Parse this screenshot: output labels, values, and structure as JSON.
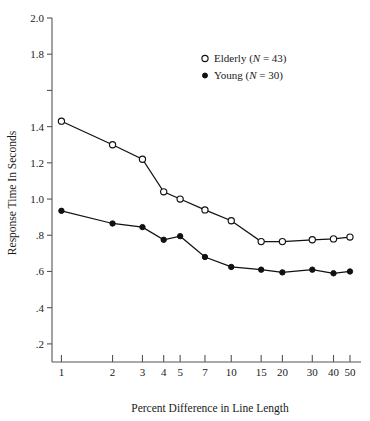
{
  "chart_data": {
    "type": "line",
    "title": "",
    "xlabel": "Percent Difference in Line Length",
    "ylabel": "Response Time In Seconds",
    "x_scale": "log",
    "x": [
      1,
      2,
      3,
      4,
      5,
      7,
      10,
      15,
      20,
      30,
      40,
      50
    ],
    "xticks": [
      1,
      2,
      3,
      4,
      5,
      7,
      10,
      15,
      20,
      30,
      40,
      50
    ],
    "xtick_labels": [
      "1",
      "2",
      "3",
      "4",
      "5",
      "7",
      "10",
      "15",
      "20",
      "30",
      "40",
      "50"
    ],
    "xlim": [
      0.88,
      55
    ],
    "yticks": [
      0.2,
      0.4,
      0.6,
      0.8,
      1.0,
      1.2,
      1.4,
      1.6,
      1.8,
      2.0
    ],
    "ytick_labels": [
      ".2",
      ".4",
      ".6",
      ".8",
      "1.0",
      "1.2",
      "1.4",
      "1.6",
      "1.8",
      "2.0"
    ],
    "ytick_labels_shown": [
      ".2",
      ".4",
      ".6",
      ".8",
      "1.0",
      "1.2",
      "1.4",
      "",
      "1.8",
      "2.0"
    ],
    "ylim": [
      0.1,
      2.0
    ],
    "grid": false,
    "legend_position": "upper-right",
    "series": [
      {
        "name": "Elderly (N = 43)",
        "legend_label": "Elderly",
        "legend_n": "(N = 43)",
        "marker": "open-circle",
        "values": [
          1.43,
          1.3,
          1.22,
          1.04,
          1.0,
          0.94,
          0.88,
          0.765,
          0.765,
          0.775,
          0.78,
          0.79
        ]
      },
      {
        "name": "Young (N = 30)",
        "legend_label": "Young",
        "legend_n": "(N = 30)",
        "marker": "filled-circle",
        "values": [
          0.935,
          0.865,
          0.845,
          0.775,
          0.795,
          0.68,
          0.625,
          0.61,
          0.595,
          0.61,
          0.59,
          0.6
        ]
      }
    ]
  },
  "colors": {
    "axis": "#555555",
    "data": "#111111",
    "background": "#ffffff",
    "marker_open_fill": "#ffffff"
  }
}
